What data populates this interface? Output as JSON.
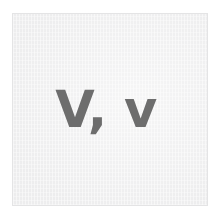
{
  "card": {
    "glyph_pair": "V, v",
    "uppercase_letter": "V",
    "separator": ",",
    "lowercase_letter": "v",
    "text_color": "#6d6d6d",
    "background_color": "#eeeeef",
    "border_color": "#e4e4e5"
  },
  "page": {
    "background_color": "#ffffff"
  }
}
